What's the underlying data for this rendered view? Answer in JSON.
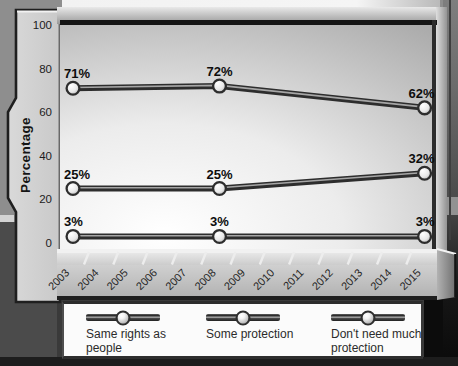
{
  "colors": {
    "chart_line": "#2d2d2d",
    "chart_line_core": "#a6a6a6",
    "marker_ring": "#2d2d2d",
    "panel_bg_light": "#ffffff",
    "panel_bg_dark": "#ababab",
    "axis_bar": "#c9c9c9",
    "legend_bg": "#fbfbfb",
    "label_text": "#0d0d0d"
  },
  "chart_data": {
    "type": "line",
    "title": "",
    "xlabel": "",
    "ylabel": "Percentage",
    "ylim": [
      0,
      100
    ],
    "yticks": [
      0,
      20,
      40,
      60,
      80,
      100
    ],
    "xlim": [
      2003,
      2015
    ],
    "x_ticks": [
      "2003",
      "2004",
      "2005",
      "2006",
      "2007",
      "2008",
      "2009",
      "2010",
      "2011",
      "2012",
      "2013",
      "2014",
      "2015"
    ],
    "x": [
      2003,
      2008,
      2015
    ],
    "series": [
      {
        "name": "Same rights as people",
        "values": [
          25,
          25,
          32
        ]
      },
      {
        "name": "Some protection",
        "values": [
          71,
          72,
          62
        ]
      },
      {
        "name": "Don't need much protection",
        "values": [
          3,
          3,
          3
        ]
      }
    ],
    "data_labels": true,
    "data_label_suffix": "%",
    "grid": false,
    "legend_position": "bottom"
  }
}
